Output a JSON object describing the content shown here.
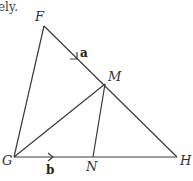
{
  "text_fragment": "ely.",
  "points": {
    "F": {
      "label": "F",
      "x": 44,
      "y": 26
    },
    "M": {
      "label": "M",
      "x": 105,
      "y": 84
    },
    "G": {
      "label": "G",
      "x": 14,
      "y": 157
    },
    "N": {
      "label": "N",
      "x": 93,
      "y": 157
    },
    "H": {
      "label": "H",
      "x": 177,
      "y": 157
    }
  },
  "segments": [
    [
      "F",
      "H"
    ],
    [
      "F",
      "G"
    ],
    [
      "G",
      "H"
    ],
    [
      "G",
      "M"
    ],
    [
      "M",
      "N"
    ]
  ],
  "vectors": {
    "a": {
      "label": "a",
      "on": "FM",
      "direction": "F to M"
    },
    "b": {
      "label": "b",
      "on": "GN",
      "direction": "G to N"
    }
  },
  "colors": {
    "line": "#3a3a3a",
    "text": "#333333"
  }
}
